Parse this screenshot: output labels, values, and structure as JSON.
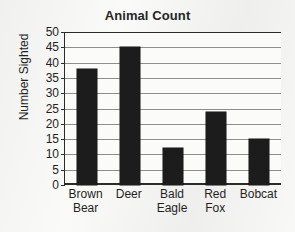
{
  "chart_data": {
    "type": "bar",
    "title": "Animal Count",
    "xlabel": "",
    "ylabel": "Number Sighted",
    "categories": [
      "Brown Bear",
      "Deer",
      "Bald Eagle",
      "Red Fox",
      "Bobcat"
    ],
    "values": [
      38,
      45,
      12,
      24,
      15
    ],
    "ylim": [
      0,
      50
    ],
    "ytick_step": 5,
    "yticks": [
      0,
      5,
      10,
      15,
      20,
      25,
      30,
      35,
      40,
      45,
      50
    ],
    "ytick_labels": [
      "0",
      "5",
      "10",
      "15",
      "20",
      "25",
      "30",
      "35",
      "40",
      "45",
      "50"
    ],
    "grid": true,
    "grid_axis": "y",
    "legend": false,
    "legend_position": "none",
    "bar_color": "#1c1c1c",
    "grid_color": "#8e8e8e",
    "axis_color": "#2b2b2b",
    "plot_background": "#fbfbfa",
    "page_background": "#f3f3f1",
    "text_color": "#1f1f1f",
    "series": [
      {
        "name": "Number Sighted",
        "values": [
          38,
          45,
          12,
          24,
          15
        ]
      }
    ]
  },
  "chart": {
    "title": "Animal Count",
    "y_axis_title": "Number Sighted"
  }
}
